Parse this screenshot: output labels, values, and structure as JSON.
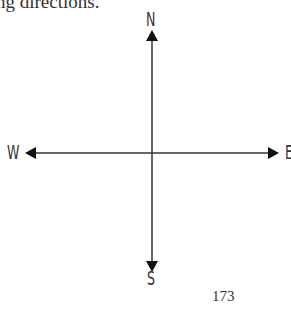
{
  "caption": "ng directions.",
  "compass": {
    "north": "N",
    "south": "S",
    "west": "W",
    "east": "E"
  },
  "page_number": "173"
}
